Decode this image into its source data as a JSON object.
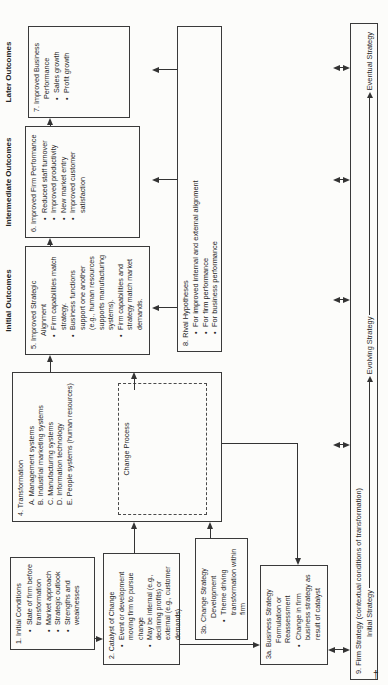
{
  "fig": {
    "headings": {
      "initial_outcomes": "Initial Outcomes",
      "intermediate_outcomes": "Intermediate Outcomes",
      "later_outcomes": "Later Outcomes"
    },
    "boxes": {
      "initial_conditions": {
        "title": "1. Initial Conditions",
        "bullets": [
          "State of firm before transformation",
          "Market approach",
          "Strategic outlook",
          "Strengths and weaknesses"
        ]
      },
      "catalyst_of_change": {
        "title": "2. Catalyst of Change",
        "bullets": [
          "Event or development moving firm to pursue change",
          "May be internal (e.g., declining profits) or external (e.g., customer demands)"
        ]
      },
      "change_strategy_development": {
        "title": "3b. Change Strategy Development",
        "bullets": [
          "Theme driving transformation within firm"
        ]
      },
      "business_strategy_formulation": {
        "title": "3a. Business Strategy Formulation or Reassessment",
        "bullets": [
          "Change in firm business strategy as result of catalyst"
        ]
      },
      "transformation": {
        "title": "4. Transformation",
        "items": [
          "A. Management systems",
          "B. Industrial marketing systems",
          "C. Manufacturing systems",
          "D. Information technology",
          "E. People systems (human resources)"
        ],
        "process_label": "Change Process"
      },
      "improved_strategic_alignment": {
        "title": "5. Improved Strategic Alignment",
        "bullets": [
          "Firm capabilities match strategy.",
          "Business functions support one another (e.g., human resources supports manufacturing systems).",
          "Firm capabilities and strategy match market demands."
        ]
      },
      "improved_firm_performance": {
        "title": "6. Improved Firm Performance",
        "bullets": [
          "Reduced staff turnover",
          "Improved productivity",
          "New market entry",
          "Improved customer satisfaction"
        ]
      },
      "improved_business_performance": {
        "title": "7. Improved Business Performance",
        "bullets": [
          "Sales growth",
          "Profit growth"
        ]
      },
      "rival_hypotheses": {
        "title": "8. Rival Hypotheses",
        "bullets": [
          "For improved internal and external alignment",
          "For firm performance",
          "For business performance"
        ]
      },
      "firm_strategy": {
        "title": "9. Firm Strategy (contextual conditions of transformation)",
        "stages": [
          "Initial Strategy",
          "Evolving Strategy",
          "Eventual Strategy"
        ]
      }
    },
    "colors": {
      "line": "#333333",
      "text": "#262626",
      "background": "#fcfcfa"
    },
    "footnote_mark": "†"
  }
}
